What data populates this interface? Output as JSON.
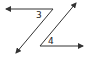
{
  "diagram": {
    "type": "geometry-angles",
    "labels": {
      "angle_top": "3",
      "angle_bottom": "4"
    },
    "colors": {
      "line": "#333333",
      "background": "#ffffff"
    }
  }
}
